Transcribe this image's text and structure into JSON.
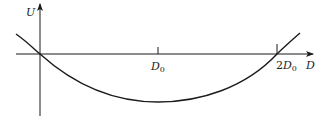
{
  "diagram": {
    "title": "",
    "y_axis": {
      "label": "U"
    },
    "x_axis": {
      "label": "D"
    },
    "ticks": [
      {
        "label_main": "D",
        "label_sub": "0",
        "prefix": ""
      },
      {
        "label_main": "D",
        "label_sub": "0",
        "prefix": "2"
      }
    ],
    "curve": {
      "description": "Parabola-like potential curve crossing zero at origin and at 2D0, minimum at D0",
      "zero_crossings": [
        "0",
        "2D0"
      ],
      "minimum_at": "D0"
    },
    "colors": {
      "line": "#1a1a1a",
      "background": "#ffffff"
    }
  }
}
